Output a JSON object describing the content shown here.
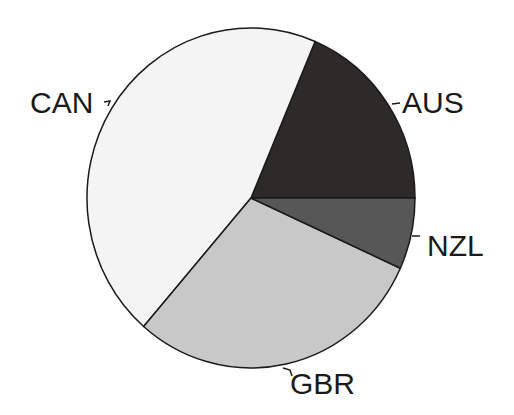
{
  "chart_data": {
    "type": "pie",
    "title": "",
    "categories": [
      "AUS",
      "CAN",
      "GBR",
      "NZL"
    ],
    "values": [
      18.6,
      45.0,
      29.6,
      6.8
    ],
    "unit": "percent (estimated share of circle)",
    "legend": "none (direct labels with leader lines)",
    "slices": [
      {
        "label": "AUS",
        "value": 18.6,
        "color": "#2e2a2a",
        "start_deg": 0.0,
        "end_deg": 67.0
      },
      {
        "label": "CAN",
        "value": 45.0,
        "color": "#f4f4f4",
        "start_deg": 67.0,
        "end_deg": 229.1
      },
      {
        "label": "GBR",
        "value": 29.6,
        "color": "#c8c8c8",
        "start_deg": 229.1,
        "end_deg": 335.6
      },
      {
        "label": "NZL",
        "value": 6.8,
        "color": "#575757",
        "start_deg": 335.6,
        "end_deg": 360.0
      }
    ],
    "angle_convention": "degrees counter-clockwise from 3 o'clock"
  },
  "labels": {
    "aus": "AUS",
    "can": "CAN",
    "gbr": "GBR",
    "nzl": "NZL"
  },
  "colors": {
    "outline": "#1a1a1a",
    "background": "#ffffff"
  }
}
